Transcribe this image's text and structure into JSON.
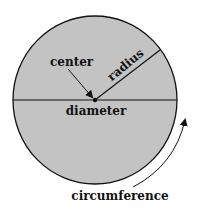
{
  "diagram": {
    "labels": {
      "center": "center",
      "radius": "radius",
      "diameter": "diameter",
      "circumference": "circumference"
    },
    "colors": {
      "fill": "#c3c3c3",
      "stroke": "#111111",
      "background": "#ffffff"
    }
  }
}
